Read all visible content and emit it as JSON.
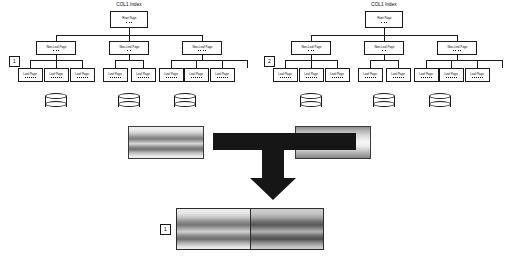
{
  "diagram": {
    "title": "",
    "trees": [
      {
        "marker": "1",
        "title": "COL1 Index",
        "root": {
          "label": "Root Page",
          "dots": 3
        },
        "nonleaf": [
          {
            "label": "Non-Leaf Page",
            "dots": 3
          },
          {
            "label": "Non-Leaf Page",
            "dots": 2
          },
          {
            "label": "Non-Leaf Page",
            "dots": 4
          }
        ],
        "leaves": [
          {
            "label": "Leaf Page",
            "dots": 6
          },
          {
            "label": "Leaf Page",
            "dots": 6
          },
          {
            "label": "Leaf Page",
            "dots": 6
          },
          {
            "label": "Leaf Page",
            "dots": 6
          },
          {
            "label": "Leaf Page",
            "dots": 6
          },
          {
            "label": "Leaf Page",
            "dots": 6
          },
          {
            "label": "Leaf Page",
            "dots": 6
          },
          {
            "label": "Leaf Page",
            "dots": 6
          }
        ],
        "cylinders": 3
      },
      {
        "marker": "2",
        "title": "COL1 Index",
        "root": {
          "label": "Root Page",
          "dots": 3
        },
        "nonleaf": [
          {
            "label": "Non-Leaf Page",
            "dots": 3
          },
          {
            "label": "Non-Leaf Page",
            "dots": 2
          },
          {
            "label": "Non-Leaf Page",
            "dots": 4
          }
        ],
        "leaves": [
          {
            "label": "Leaf Page",
            "dots": 6
          },
          {
            "label": "Leaf Page",
            "dots": 6
          },
          {
            "label": "Leaf Page",
            "dots": 6
          },
          {
            "label": "Leaf Page",
            "dots": 6
          },
          {
            "label": "Leaf Page",
            "dots": 6
          },
          {
            "label": "Leaf Page",
            "dots": 6
          },
          {
            "label": "Leaf Page",
            "dots": 6
          },
          {
            "label": "Leaf Page",
            "dots": 6
          }
        ],
        "cylinders": 3
      }
    ],
    "merge": {
      "source_left": "",
      "source_right": "",
      "arrow": "merge-arrow-down",
      "result": {
        "marker": "1",
        "left_half": "",
        "right_half": ""
      }
    },
    "colors": {
      "stroke": "#1a1a1a",
      "arrow": "#161616",
      "background": "#ffffff"
    }
  }
}
